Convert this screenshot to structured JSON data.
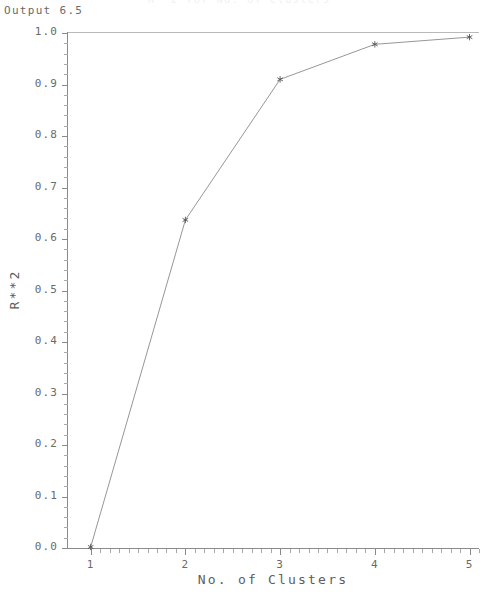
{
  "window": {
    "output_label": "Output 6.5",
    "figure_caption": "R**2 for No. of Clusters"
  },
  "chart_data": {
    "type": "line",
    "title": "",
    "xlabel": "No. of Clusters",
    "ylabel": "R**2",
    "x": [
      1,
      2,
      3,
      4,
      5
    ],
    "values": [
      0.002,
      0.637,
      0.91,
      0.978,
      0.992
    ],
    "xlim": [
      0.75,
      5.1
    ],
    "ylim": [
      0.0,
      1.0
    ],
    "xticks": [
      "1",
      "2",
      "3",
      "4",
      "5"
    ],
    "yticks": [
      "0.0",
      "0.1",
      "0.2",
      "0.3",
      "0.4",
      "0.5",
      "0.6",
      "0.7",
      "0.8",
      "0.9",
      "1.0"
    ],
    "grid": false,
    "legend": null,
    "marker": "asterisk",
    "line_color": "#8a8a8a",
    "marker_color": "#555555",
    "axis_color": "#8a8a8a",
    "background": "#ffffff"
  }
}
